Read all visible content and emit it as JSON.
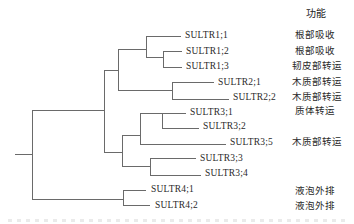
{
  "figure": {
    "type": "phylogenetic-tree",
    "line_color": "#6a6a6a",
    "text_color": "#2a2a2a",
    "background": "#ffffff"
  },
  "tree": {
    "header": {
      "text": "功能"
    },
    "segments": [
      [
        15,
        154.5,
        32,
        154.5
      ],
      [
        32,
        110.5,
        32,
        199.5
      ],
      [
        32,
        110.5,
        104,
        110.5
      ],
      [
        104,
        70.5,
        104,
        152
      ],
      [
        104,
        70.5,
        118,
        70.5
      ],
      [
        118,
        49.5,
        118,
        90.5
      ],
      [
        118,
        49.5,
        146,
        49.5
      ],
      [
        118,
        90.5,
        172,
        90.5
      ],
      [
        146,
        36,
        146,
        57
      ],
      [
        146,
        36,
        181,
        36
      ],
      [
        146,
        57,
        163,
        57
      ],
      [
        163,
        51,
        163,
        67
      ],
      [
        163,
        51,
        182,
        51
      ],
      [
        163,
        67,
        182,
        67
      ],
      [
        172,
        82,
        172,
        99
      ],
      [
        172,
        82,
        214,
        82
      ],
      [
        172,
        99,
        229,
        99
      ],
      [
        104,
        152,
        122,
        152
      ],
      [
        122,
        135,
        122,
        166.5
      ],
      [
        122,
        135,
        140,
        135
      ],
      [
        122,
        166.5,
        150,
        166.5
      ],
      [
        140,
        113,
        140,
        144.5
      ],
      [
        140,
        113,
        186,
        113
      ],
      [
        162,
        113,
        162,
        128
      ],
      [
        162,
        128,
        199,
        128
      ],
      [
        140,
        144.5,
        226,
        144.5
      ],
      [
        150,
        158,
        150,
        175
      ],
      [
        150,
        158,
        196,
        158
      ],
      [
        150,
        175,
        201,
        175
      ],
      [
        32,
        199.5,
        123,
        199.5
      ],
      [
        123,
        190,
        123,
        205
      ],
      [
        123,
        190,
        146,
        190
      ],
      [
        123,
        205,
        150,
        205
      ]
    ],
    "gene_labels": [
      {
        "text": "SULTR1;1",
        "x": 185,
        "y": 36
      },
      {
        "text": "SULTR1;2",
        "x": 186,
        "y": 52
      },
      {
        "text": "SULTR1;3",
        "x": 186,
        "y": 67
      },
      {
        "text": "SULTR2;1",
        "x": 218,
        "y": 83
      },
      {
        "text": "SULTR2;2",
        "x": 233,
        "y": 98
      },
      {
        "text": "SULTR3;1",
        "x": 190,
        "y": 113
      },
      {
        "text": "SULTR3;2",
        "x": 203,
        "y": 127
      },
      {
        "text": "SULTR3;5",
        "x": 230,
        "y": 143
      },
      {
        "text": "SULTR3;3",
        "x": 200,
        "y": 159
      },
      {
        "text": "SULTR3;4",
        "x": 205,
        "y": 174
      },
      {
        "text": "SULTR4;1",
        "x": 151,
        "y": 190
      },
      {
        "text": "SULTR4;2",
        "x": 155,
        "y": 206
      }
    ],
    "function_labels": [
      {
        "text": "根部吸收",
        "x": 295,
        "y": 36
      },
      {
        "text": "根部吸收",
        "x": 295,
        "y": 52
      },
      {
        "text": "韧皮部转运",
        "x": 292,
        "y": 67
      },
      {
        "text": "木质部转运",
        "x": 292,
        "y": 83
      },
      {
        "text": "木质部转运",
        "x": 292,
        "y": 98
      },
      {
        "text": "质体转运",
        "x": 295,
        "y": 112
      },
      {
        "text": "木质部转运",
        "x": 292,
        "y": 143
      },
      {
        "text": "液泡外排",
        "x": 295,
        "y": 192
      },
      {
        "text": "液泡外排",
        "x": 295,
        "y": 207
      }
    ]
  }
}
